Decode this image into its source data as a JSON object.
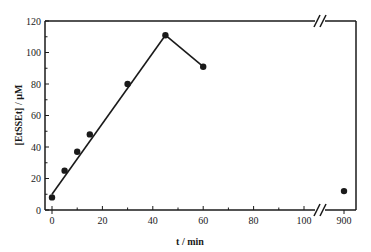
{
  "chart_data": {
    "type": "scatter",
    "title": "",
    "xlabel": "t / min",
    "ylabel": "[EtSSEt] / µM",
    "xlim": [
      0,
      100
    ],
    "x_break": {
      "after": 100,
      "resume_at": 900
    },
    "ylim": [
      0,
      120
    ],
    "x_ticks": [
      "0",
      "20",
      "40",
      "60",
      "80",
      "100",
      "900"
    ],
    "y_ticks": [
      "0",
      "20",
      "40",
      "60",
      "80",
      "100",
      "120"
    ],
    "grid": false,
    "legend": null,
    "series": [
      {
        "name": "data points",
        "marker": "filled-circle",
        "x": [
          0,
          5,
          10,
          15,
          30,
          45,
          60,
          900
        ],
        "y": [
          8,
          25,
          37,
          48,
          80,
          111,
          91,
          12
        ]
      },
      {
        "name": "fit line rising",
        "marker": "line",
        "x": [
          0,
          45
        ],
        "y": [
          10,
          111
        ]
      },
      {
        "name": "fit line falling",
        "marker": "line",
        "x": [
          45,
          60
        ],
        "y": [
          111,
          91
        ]
      }
    ]
  }
}
